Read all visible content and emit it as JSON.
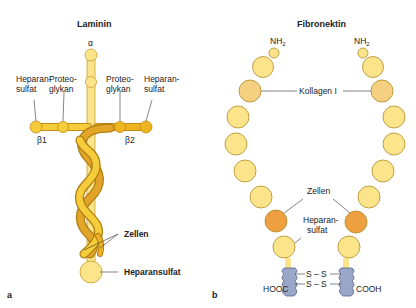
{
  "panel_a": {
    "letter": "a",
    "title": "Laminin",
    "alpha": "α",
    "labels": {
      "heparansulfat_left_1": "Heparan-",
      "heparansulfat_left_2": "sulfat",
      "proteoglykan_left_1": "Proteo-",
      "proteoglykan_left_2": "glykan",
      "proteoglykan_right_1": "Proteo-",
      "proteoglykan_right_2": "glykan",
      "heparansulfat_right_1": "Heparan-",
      "heparansulfat_right_2": "sulfat",
      "beta1": "β1",
      "beta2": "β2",
      "zellen": "Zellen",
      "heparansulfat_bottom": "Heparansulfat"
    }
  },
  "panel_b": {
    "letter": "b",
    "title": "Fibronektin",
    "labels": {
      "nh2_left": "NH",
      "nh2_right": "NH",
      "subscript": "2",
      "kollagen": "Kollagen I",
      "zellen": "Zellen",
      "heparansulfat_1": "Heparan-",
      "heparansulfat_2": "sulfat",
      "ss_top": "S – S",
      "ss_bottom": "S – S",
      "hooc": "HOOC",
      "cooh": "COOH"
    }
  },
  "colors": {
    "pale_yellow": "#fbe48a",
    "yellow": "#f5cc3a",
    "gold": "#eeb523",
    "dark_gold": "#d99a1c",
    "orange": "#eea040",
    "light_orange": "#f4d080",
    "blue_gray": "#9aa6c8",
    "outline": "#b88a1e"
  }
}
